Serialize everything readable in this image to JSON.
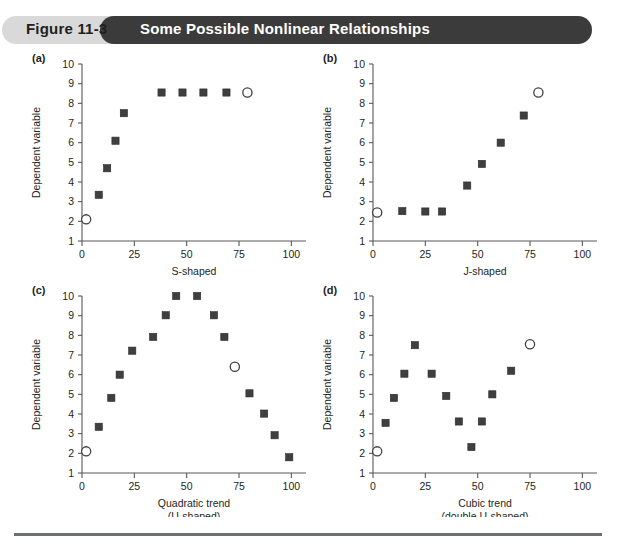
{
  "header": {
    "figure_number": "Figure 11-3",
    "title": "Some Possible Nonlinear Relationships",
    "pill_bg": "#d9d9d9",
    "title_bg": "#3b3b3b",
    "title_color": "#ffffff"
  },
  "axis_common": {
    "ylabel": "Dependent variable",
    "yticks": [
      1,
      2,
      3,
      4,
      5,
      6,
      7,
      8,
      9,
      10
    ],
    "xticks": [
      0,
      25,
      50,
      75,
      100
    ],
    "ylim": [
      1,
      10
    ],
    "xlim": [
      0,
      107
    ],
    "marker_filled_color": "#3f3f3f",
    "marker_open_color": "#ffffff",
    "axis_color": "#58595b"
  },
  "panels": [
    {
      "id": "a",
      "tag": "(a)",
      "xlabel": "S-shaped",
      "xlabel2": ""
    },
    {
      "id": "b",
      "tag": "(b)",
      "xlabel": "J-shaped",
      "xlabel2": ""
    },
    {
      "id": "c",
      "tag": "(c)",
      "xlabel": "Quadratic trend",
      "xlabel2": "(U-shaped)"
    },
    {
      "id": "d",
      "tag": "(d)",
      "xlabel": "Cubic trend",
      "xlabel2": "(double U-shaped)"
    }
  ],
  "chart_data": [
    {
      "type": "scatter",
      "panel": "a",
      "title": "S-shaped",
      "xlabel": "S-shaped",
      "ylabel": "Dependent variable",
      "xlim": [
        0,
        107
      ],
      "ylim": [
        1,
        10
      ],
      "xticks": [
        0,
        25,
        50,
        75,
        100
      ],
      "yticks": [
        1,
        2,
        3,
        4,
        5,
        6,
        7,
        8,
        9,
        10
      ],
      "grid": false,
      "legend": "none",
      "series": [
        {
          "name": "filled-squares",
          "marker": "filled-square",
          "points": [
            {
              "x": 8,
              "y": 3.35
            },
            {
              "x": 12,
              "y": 4.7
            },
            {
              "x": 16,
              "y": 6.1
            },
            {
              "x": 20,
              "y": 7.5
            },
            {
              "x": 38,
              "y": 8.55
            },
            {
              "x": 48,
              "y": 8.55
            },
            {
              "x": 58,
              "y": 8.55
            },
            {
              "x": 69,
              "y": 8.55
            }
          ]
        },
        {
          "name": "open-circles",
          "marker": "open-circle",
          "points": [
            {
              "x": 2,
              "y": 2.1
            },
            {
              "x": 79,
              "y": 8.55
            }
          ]
        }
      ]
    },
    {
      "type": "scatter",
      "panel": "b",
      "title": "J-shaped",
      "xlabel": "J-shaped",
      "ylabel": "Dependent variable",
      "xlim": [
        0,
        107
      ],
      "ylim": [
        1,
        10
      ],
      "xticks": [
        0,
        25,
        50,
        75,
        100
      ],
      "yticks": [
        1,
        2,
        3,
        4,
        5,
        6,
        7,
        8,
        9,
        10
      ],
      "grid": false,
      "legend": "none",
      "series": [
        {
          "name": "filled-squares",
          "marker": "filled-square",
          "points": [
            {
              "x": 14,
              "y": 2.52
            },
            {
              "x": 25,
              "y": 2.5
            },
            {
              "x": 33,
              "y": 2.5
            },
            {
              "x": 45,
              "y": 3.82
            },
            {
              "x": 52,
              "y": 4.92
            },
            {
              "x": 61,
              "y": 6.0
            },
            {
              "x": 72,
              "y": 7.38
            }
          ]
        },
        {
          "name": "open-circles",
          "marker": "open-circle",
          "points": [
            {
              "x": 2,
              "y": 2.45
            },
            {
              "x": 79,
              "y": 8.55
            }
          ]
        }
      ]
    },
    {
      "type": "scatter",
      "panel": "c",
      "title": "Quadratic trend (U-shaped)",
      "xlabel": "Quadratic trend",
      "xlabel_line2": "(U-shaped)",
      "ylabel": "Dependent variable",
      "xlim": [
        0,
        107
      ],
      "ylim": [
        1,
        10
      ],
      "xticks": [
        0,
        25,
        50,
        75,
        100
      ],
      "yticks": [
        1,
        2,
        3,
        4,
        5,
        6,
        7,
        8,
        9,
        10
      ],
      "grid": false,
      "legend": "none",
      "series": [
        {
          "name": "filled-squares",
          "marker": "filled-square",
          "points": [
            {
              "x": 8,
              "y": 3.35
            },
            {
              "x": 14,
              "y": 4.82
            },
            {
              "x": 18,
              "y": 6.0
            },
            {
              "x": 24,
              "y": 7.22
            },
            {
              "x": 34,
              "y": 7.92
            },
            {
              "x": 40,
              "y": 9.02
            },
            {
              "x": 45,
              "y": 10.0
            },
            {
              "x": 55,
              "y": 10.0
            },
            {
              "x": 63,
              "y": 9.02
            },
            {
              "x": 68,
              "y": 7.92
            },
            {
              "x": 80,
              "y": 5.05
            },
            {
              "x": 87,
              "y": 4.02
            },
            {
              "x": 92,
              "y": 2.92
            },
            {
              "x": 99,
              "y": 1.8
            }
          ]
        },
        {
          "name": "open-circles",
          "marker": "open-circle",
          "points": [
            {
              "x": 2,
              "y": 2.1
            },
            {
              "x": 73,
              "y": 6.4
            }
          ]
        }
      ]
    },
    {
      "type": "scatter",
      "panel": "d",
      "title": "Cubic trend (double U-shaped)",
      "xlabel": "Cubic trend",
      "xlabel_line2": "(double U-shaped)",
      "ylabel": "Dependent variable",
      "xlim": [
        0,
        107
      ],
      "ylim": [
        1,
        10
      ],
      "xticks": [
        0,
        25,
        50,
        75,
        100
      ],
      "yticks": [
        1,
        2,
        3,
        4,
        5,
        6,
        7,
        8,
        9,
        10
      ],
      "grid": false,
      "legend": "none",
      "series": [
        {
          "name": "filled-squares",
          "marker": "filled-square",
          "points": [
            {
              "x": 6,
              "y": 3.55
            },
            {
              "x": 10,
              "y": 4.82
            },
            {
              "x": 15,
              "y": 6.05
            },
            {
              "x": 20,
              "y": 7.5
            },
            {
              "x": 28,
              "y": 6.05
            },
            {
              "x": 35,
              "y": 4.92
            },
            {
              "x": 41,
              "y": 3.62
            },
            {
              "x": 47,
              "y": 2.32
            },
            {
              "x": 52,
              "y": 3.62
            },
            {
              "x": 57,
              "y": 5.0
            },
            {
              "x": 66,
              "y": 6.2
            }
          ]
        },
        {
          "name": "open-circles",
          "marker": "open-circle",
          "points": [
            {
              "x": 2,
              "y": 2.1
            },
            {
              "x": 75,
              "y": 7.55
            }
          ]
        }
      ]
    }
  ]
}
